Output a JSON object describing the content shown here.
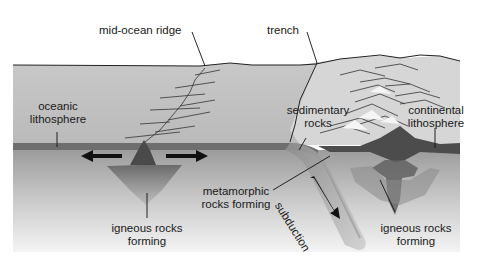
{
  "diagram": {
    "labels": {
      "mid_ocean_ridge": "mid-ocean ridge",
      "trench": "trench",
      "oceanic_lithosphere_1": "oceanic",
      "oceanic_lithosphere_2": "lithosphere",
      "sedimentary_rocks_1": "sedimentary",
      "sedimentary_rocks_2": "rocks",
      "continental_lithosphere_1": "continental",
      "continental_lithosphere_2": "lithosphere",
      "metamorphic_rocks_1": "metamorphic",
      "metamorphic_rocks_2": "rocks forming",
      "subduction": "subduction",
      "igneous_left_1": "igneous rocks",
      "igneous_left_2": "forming",
      "igneous_right_1": "igneous rocks",
      "igneous_right_2": "forming"
    },
    "colors": {
      "ocean_top": "#c8c8c8",
      "ocean_body": "#bdbdbd",
      "lithosphere_band": "#6e6e6e",
      "mantle_top": "#9a9a9a",
      "mantle_bottom": "#f2f2f2",
      "magma": "#5a5a5a",
      "arrow": "#111111"
    }
  }
}
